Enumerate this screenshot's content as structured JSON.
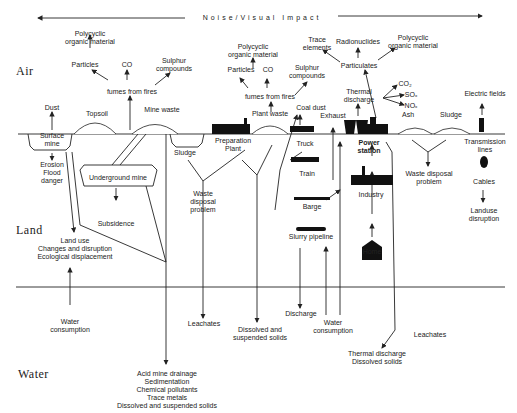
{
  "header": {
    "label": "Noise/Visual Impact"
  },
  "zones": {
    "air": "Air",
    "land": "Land",
    "water": "Water"
  },
  "labels": {
    "poly1": "Polycyclic\norganic material",
    "particles1": "Particles",
    "co1": "CO",
    "sulphur1": "Sulphur\ncompounds",
    "fumes1": "fumes from fires",
    "dust": "Dust",
    "topsoil": "Topsoil",
    "mine_waste": "Mine waste",
    "surface_mine": "Surface\nmine",
    "erosion": "Erosion\nFlood\ndanger",
    "underground_mine": "Underground mine",
    "subsidence": "Subsidence",
    "land_use": "Land use\nChanges and disruption\nEcological displacement",
    "water_consumption1": "Water\nconsumption",
    "sludge1": "Sludge",
    "prep_plant": "Preparation\nPlant",
    "waste_disposal1": "Waste\ndisposal\nproblem",
    "leachates1": "Leachates",
    "acid": "Acid mine drainage\nSedimentation\nChemical pollutants\nTrace metals\nDissolved and suspended solids",
    "poly2": "Polycyclic\norganic material",
    "particles2": "Particles",
    "co2": "CO",
    "sulphur2": "Sulphur\ncompounds",
    "fumes2": "fumes from fires",
    "plant_waste": "Plant waste",
    "coal_dust": "Coal dust",
    "exhaust": "Exhaust",
    "truck": "Truck",
    "train": "Train",
    "barge": "Barge",
    "slurry": "Slurry pipeline",
    "dissolved": "Dissolved and\nsuspended solids",
    "discharge": "Discharge",
    "water_consumption2": "Water\nconsumption",
    "trace": "Trace\nelements",
    "radionuclides": "Radionuclides",
    "poly3": "Polycyclic\norganic material",
    "particulates": "Particulates",
    "thermal": "Thermal\ndischarge",
    "gas_co2": "CO₂",
    "gas_sox": "SOₓ",
    "gas_nox": "NOₓ",
    "power_station": "Power\nstation",
    "industry": "Industry",
    "home": "Home",
    "ash": "Ash",
    "sludge2": "Sludge",
    "waste_disposal2": "Waste disposal\nproblem",
    "electric": "Electric fields",
    "transmission": "Transmission\nlines",
    "cables": "Cables",
    "landuse_disruption": "Landuse\ndisruption",
    "thermal_water": "Thermal discharge\nDissolved solids",
    "leachates2": "Leachates"
  }
}
